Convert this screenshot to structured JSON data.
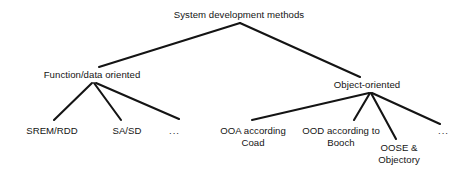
{
  "diagram": {
    "type": "tree",
    "background_color": "#ffffff",
    "line_color": "#141414",
    "text_color": "#141414",
    "root": {
      "id": "root",
      "label": "System development methods"
    },
    "level1": [
      {
        "id": "function-data",
        "label": "Function/data oriented"
      },
      {
        "id": "object-oriented",
        "label": "Object-oriented"
      }
    ],
    "level2_left": [
      {
        "id": "srem-rdd",
        "label": "SREM/RDD"
      },
      {
        "id": "sa-sd",
        "label": "SA/SD"
      },
      {
        "id": "ellipsis-left",
        "label": "..."
      }
    ],
    "level2_right": [
      {
        "id": "ooa-coad",
        "label_line1": "OOA according",
        "label_line2": "Coad"
      },
      {
        "id": "ood-booch",
        "label_line1": "OOD according to",
        "label_line2": "Booch"
      },
      {
        "id": "oose-objectory",
        "label_line1": "OOSE &",
        "label_line2": "Objectory"
      },
      {
        "id": "ellipsis-right",
        "label": "..."
      }
    ],
    "edges": [
      {
        "from": "root",
        "to": "function-data"
      },
      {
        "from": "root",
        "to": "object-oriented"
      },
      {
        "from": "function-data",
        "to": "srem-rdd"
      },
      {
        "from": "function-data",
        "to": "sa-sd"
      },
      {
        "from": "function-data",
        "to": "ellipsis-left"
      },
      {
        "from": "object-oriented",
        "to": "ooa-coad"
      },
      {
        "from": "object-oriented",
        "to": "ood-booch"
      },
      {
        "from": "object-oriented",
        "to": "oose-objectory"
      },
      {
        "from": "object-oriented",
        "to": "ellipsis-right"
      }
    ]
  }
}
